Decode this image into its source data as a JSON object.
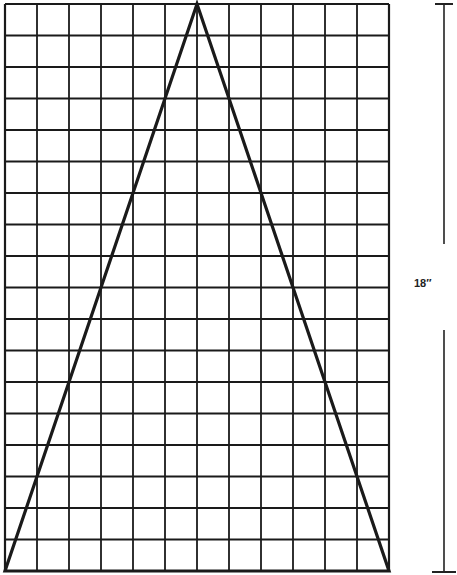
{
  "diagram": {
    "type": "pattern-grid",
    "grid": {
      "columns": 12,
      "rows": 18,
      "left": 5,
      "top": 4,
      "cell_width": 32,
      "cell_height": 31.5,
      "line_color": "#1a1a1a"
    },
    "triangle": {
      "apex_col": 6,
      "apex_row": 0,
      "base_left_col": 0,
      "base_right_col": 12,
      "base_row": 18,
      "stroke_color": "#1a1a1a"
    },
    "dimension": {
      "label": "18″",
      "x": 444,
      "top": 4,
      "bottom": 572,
      "gap_top": 244,
      "gap_bottom": 330
    }
  }
}
